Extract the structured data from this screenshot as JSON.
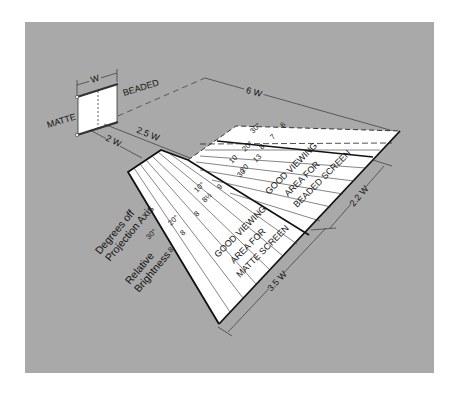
{
  "diagram": {
    "screen": {
      "width_label": "W",
      "left_label": "MATTE",
      "right_label": "BEADED"
    },
    "dimensions": {
      "matte_start": "2 W",
      "beaded_start": "2.5 W",
      "beaded_length": "6 W",
      "beaded_width": "2.2 W",
      "matte_length": "3.5 W"
    },
    "axis_labels": {
      "degrees": [
        "Degrees off",
        "Projection Axis"
      ],
      "brightness": [
        "Relative",
        "Brightness"
      ]
    },
    "matte_scale": {
      "degrees": [
        "30°",
        "20°",
        "10°"
      ],
      "brightness": [
        "8",
        "8",
        "8",
        "8½",
        "9"
      ]
    },
    "beaded_scale": {
      "degrees": [
        "30°",
        "20°",
        "10",
        "30"
      ],
      "brightness": [
        "6",
        "7",
        "8",
        "13",
        "20",
        "20"
      ]
    },
    "areas": {
      "matte": [
        "GOOD VIEWING",
        "AREA FOR",
        "MATTE SCREEN"
      ],
      "beaded": [
        "GOOD VIEWING",
        "AREA FOR",
        "BEADED SCREEN"
      ]
    },
    "colors": {
      "background": "#ffffff",
      "panel": "#a9a9a9",
      "area_fill": "#ffffff",
      "line": "#111111"
    }
  }
}
